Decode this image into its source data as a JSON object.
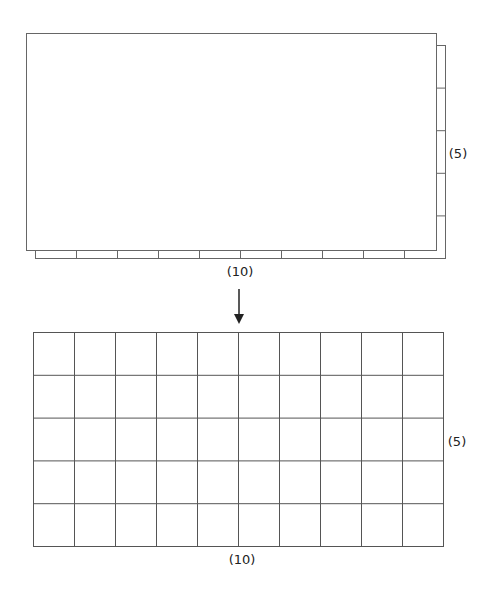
{
  "diagram": {
    "top": {
      "columns_label": "(10)",
      "rows_label": "(5)",
      "columns": 10,
      "rows": 5
    },
    "arrow": {
      "direction": "down"
    },
    "bottom": {
      "columns_label": "(10)",
      "rows_label": "(5)",
      "columns": 10,
      "rows": 5
    },
    "colors": {
      "line": "#555555",
      "background": "#ffffff"
    }
  }
}
